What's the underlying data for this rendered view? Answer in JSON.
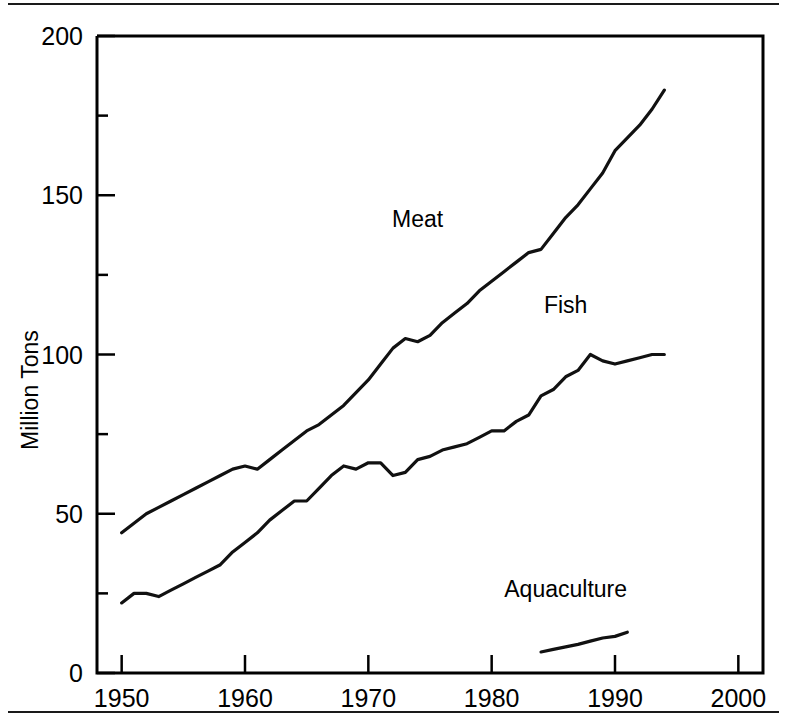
{
  "figure": {
    "background_color": "#ffffff",
    "line_color": "#111111",
    "rule_color": "#1a1a1a",
    "top_rule_name": "top-divider-rule",
    "bottom_rule_name": "bottom-divider-rule"
  },
  "chart_data": {
    "type": "line",
    "title": "",
    "xlabel": "",
    "ylabel": "Million Tons",
    "xlim": [
      1948,
      2002
    ],
    "ylim": [
      0,
      200
    ],
    "grid": false,
    "legend": "inline-labels",
    "x_major_ticks": [
      1950,
      1960,
      1970,
      1980,
      1990,
      2000
    ],
    "x_tick_labels": [
      "1950",
      "1960",
      "1970",
      "1980",
      "1990",
      "2000"
    ],
    "y_major_ticks": [
      0,
      50,
      100,
      150,
      200
    ],
    "y_tick_labels": [
      "0",
      "50",
      "100",
      "150",
      "200"
    ],
    "y_minor_ticks": [
      25,
      75,
      125,
      175
    ],
    "annotations": [
      {
        "text": "Meat",
        "x": 1974,
        "y": 140
      },
      {
        "text": "Fish",
        "x": 1986,
        "y": 113
      },
      {
        "text": "Aquaculture",
        "x": 1986,
        "y": 24
      }
    ],
    "series": [
      {
        "name": "Meat",
        "x": [
          1950,
          1951,
          1952,
          1953,
          1954,
          1955,
          1956,
          1957,
          1958,
          1959,
          1960,
          1961,
          1962,
          1963,
          1964,
          1965,
          1966,
          1967,
          1968,
          1969,
          1970,
          1971,
          1972,
          1973,
          1974,
          1975,
          1976,
          1977,
          1978,
          1979,
          1980,
          1981,
          1982,
          1983,
          1984,
          1985,
          1986,
          1987,
          1988,
          1989,
          1990,
          1991,
          1992,
          1993,
          1994
        ],
        "values": [
          44,
          47,
          50,
          52,
          54,
          56,
          58,
          60,
          62,
          64,
          65,
          64,
          67,
          70,
          73,
          76,
          78,
          81,
          84,
          88,
          92,
          97,
          102,
          105,
          104,
          106,
          110,
          113,
          116,
          120,
          123,
          126,
          129,
          132,
          133,
          138,
          143,
          147,
          152,
          157,
          164,
          168,
          172,
          177,
          183
        ]
      },
      {
        "name": "Fish",
        "x": [
          1950,
          1951,
          1952,
          1953,
          1954,
          1955,
          1956,
          1957,
          1958,
          1959,
          1960,
          1961,
          1962,
          1963,
          1964,
          1965,
          1966,
          1967,
          1968,
          1969,
          1970,
          1971,
          1972,
          1973,
          1974,
          1975,
          1976,
          1977,
          1978,
          1979,
          1980,
          1981,
          1982,
          1983,
          1984,
          1985,
          1986,
          1987,
          1988,
          1989,
          1990,
          1991,
          1992,
          1993,
          1994
        ],
        "values": [
          22,
          25,
          25,
          24,
          26,
          28,
          30,
          32,
          34,
          38,
          41,
          44,
          48,
          51,
          54,
          54,
          58,
          62,
          65,
          64,
          66,
          66,
          62,
          63,
          67,
          68,
          70,
          71,
          72,
          74,
          76,
          76,
          79,
          81,
          87,
          89,
          93,
          95,
          100,
          98,
          97,
          98,
          99,
          100,
          100
        ]
      },
      {
        "name": "Aquaculture",
        "x": [
          1984,
          1985,
          1986,
          1987,
          1988,
          1989,
          1990,
          1991
        ],
        "values": [
          6.6,
          7.4,
          8.2,
          9.0,
          10.0,
          11.0,
          11.5,
          12.8
        ]
      }
    ]
  }
}
